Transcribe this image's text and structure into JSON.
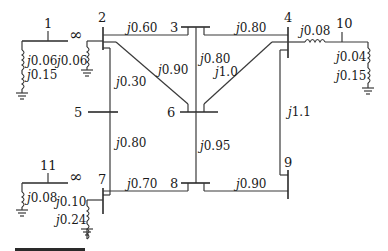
{
  "diagram": {
    "type": "power-system-reactance-diagram",
    "buses": [
      "1",
      "2",
      "3",
      "4",
      "5",
      "6",
      "7",
      "8",
      "9",
      "10",
      "11"
    ],
    "infinite_bus_symbol": "∞",
    "labels": {
      "bus1": "1",
      "bus2": "2",
      "bus3": "3",
      "bus4": "4",
      "bus5": "5",
      "bus6": "6",
      "bus7": "7",
      "bus8": "8",
      "bus9": "9",
      "bus10": "10",
      "bus11": "11"
    },
    "reactances": {
      "gen1_x1": "j0.06",
      "gen1_x2": "j0.15",
      "gen2_shunt": "j0.06",
      "line_2_3": "j0.60",
      "line_2_6": "j0.90",
      "line_2_5": "j0.30",
      "line_5_7": "j0.80",
      "line_3_4": "j0.80",
      "line_3_6": "j0.80",
      "line_4_6": "j1.0",
      "line_4_10": "j0.08",
      "gen10_x1": "j0.04",
      "gen10_x2": "j0.15",
      "line_6_8": "j0.95",
      "line_4_9": "j1.1",
      "line_7_8": "j0.70",
      "line_8_9": "j0.90",
      "gen11_x": "j0.08",
      "gen7_x1": "j0.10",
      "gen7_x2": "j0.24"
    },
    "branches": [
      {
        "from": "2",
        "to": "3",
        "x": "j0.60"
      },
      {
        "from": "2",
        "to": "6",
        "x": "j0.90"
      },
      {
        "from": "2",
        "to": "5",
        "x": "j0.30"
      },
      {
        "from": "5",
        "to": "7",
        "x": "j0.80"
      },
      {
        "from": "3",
        "to": "4",
        "x": "j0.80"
      },
      {
        "from": "3",
        "to": "6",
        "x": "j0.80"
      },
      {
        "from": "4",
        "to": "6",
        "x": "j1.0"
      },
      {
        "from": "4",
        "to": "10",
        "x": "j0.08"
      },
      {
        "from": "4",
        "to": "9",
        "x": "j1.1"
      },
      {
        "from": "6",
        "to": "8",
        "x": "j0.95"
      },
      {
        "from": "7",
        "to": "8",
        "x": "j0.70"
      },
      {
        "from": "8",
        "to": "9",
        "x": "j0.90"
      }
    ],
    "caption_partial": "FIGURE"
  }
}
